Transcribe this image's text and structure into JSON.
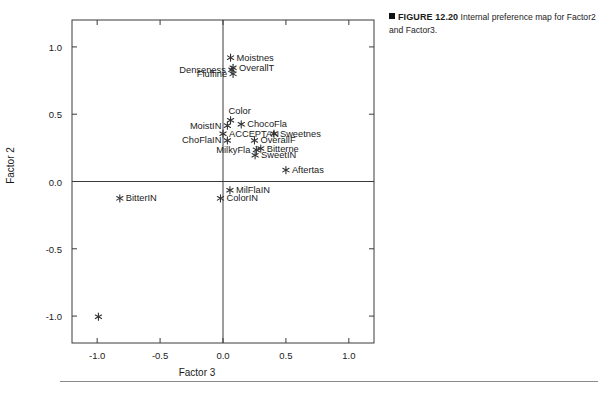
{
  "figure": {
    "bullet": "■",
    "label": "FIGURE 12.20",
    "text": "Internal preference map for Factor2 and Factor3."
  },
  "chart_data": {
    "type": "scatter",
    "title": "",
    "xlabel": "Factor 3",
    "ylabel": "Factor 2",
    "xlim": [
      -1.2,
      1.2
    ],
    "ylim": [
      -1.2,
      1.2
    ],
    "xticks": [
      "-1.0",
      "-0.5",
      "0.0",
      "0.5",
      "1.0"
    ],
    "xtickvalues": [
      -1.0,
      -0.5,
      0.0,
      0.5,
      1.0
    ],
    "yticks": [
      "1.0",
      "0.5",
      "0.0",
      "-0.5",
      "-1.0"
    ],
    "ytickvalues": [
      1.0,
      0.5,
      0.0,
      -0.5,
      -1.0
    ],
    "grid": false,
    "legend": "none",
    "marker": "asterisk",
    "zero_lines": true,
    "points": [
      {
        "label": "Moistnes",
        "x": 0.06,
        "y": 0.92,
        "side": "right"
      },
      {
        "label": "OverallT",
        "x": 0.08,
        "y": 0.845,
        "side": "right"
      },
      {
        "label": "Denseness",
        "x": 0.07,
        "y": 0.83,
        "side": "left"
      },
      {
        "label": "Fluffine",
        "x": 0.08,
        "y": 0.8,
        "side": "left"
      },
      {
        "label": "Color",
        "x": 0.06,
        "y": 0.455,
        "side": "above"
      },
      {
        "label": "ChocoFla",
        "x": 0.145,
        "y": 0.425,
        "side": "right"
      },
      {
        "label": "MoistIN",
        "x": 0.035,
        "y": 0.415,
        "side": "left"
      },
      {
        "label": "ACCEPTAN",
        "x": 0.0,
        "y": 0.355,
        "side": "right"
      },
      {
        "label": "Sweetnes",
        "x": 0.405,
        "y": 0.355,
        "side": "right"
      },
      {
        "label": "ChoFlaIN",
        "x": 0.035,
        "y": 0.305,
        "side": "left"
      },
      {
        "label": "OverallF",
        "x": 0.25,
        "y": 0.305,
        "side": "right"
      },
      {
        "label": "Bitterne",
        "x": 0.3,
        "y": 0.245,
        "side": "right"
      },
      {
        "label": "MilkyFla",
        "x": 0.265,
        "y": 0.235,
        "side": "left"
      },
      {
        "label": "SweetIN",
        "x": 0.255,
        "y": 0.195,
        "side": "right"
      },
      {
        "label": "Aftertas",
        "x": 0.5,
        "y": 0.085,
        "side": "right"
      },
      {
        "label": "MilFlaIN",
        "x": 0.055,
        "y": -0.065,
        "side": "right"
      },
      {
        "label": "ColorIN",
        "x": -0.02,
        "y": -0.125,
        "side": "right"
      },
      {
        "label": "BitterIN",
        "x": -0.82,
        "y": -0.125,
        "side": "right"
      },
      {
        "label": "",
        "x": -0.99,
        "y": -1.005,
        "side": "right"
      }
    ]
  }
}
